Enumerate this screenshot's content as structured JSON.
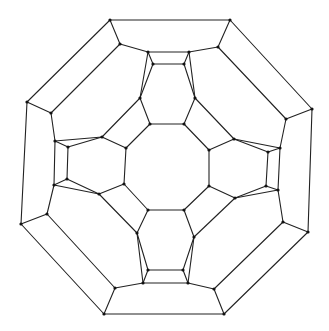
{
  "diagram": {
    "title": "",
    "type": "planar graph (Schlegel-style diagram)",
    "stroke_color": "#222222",
    "vertex_color": "#111111",
    "vertices": [
      [
        110,
        20
      ],
      [
        230,
        20
      ],
      [
        312,
        109
      ],
      [
        308,
        232
      ],
      [
        224,
        314
      ],
      [
        104,
        314
      ],
      [
        21,
        224
      ],
      [
        27,
        102
      ],
      [
        120,
        44
      ],
      [
        218,
        47
      ],
      [
        286,
        119
      ],
      [
        283,
        222
      ],
      [
        214,
        289
      ],
      [
        115,
        288
      ],
      [
        47,
        214
      ],
      [
        51,
        113
      ],
      [
        148,
        52
      ],
      [
        189,
        52
      ],
      [
        184,
        64
      ],
      [
        153,
        64
      ],
      [
        280,
        148
      ],
      [
        278,
        190
      ],
      [
        266,
        186
      ],
      [
        268,
        152
      ],
      [
        188,
        283
      ],
      [
        143,
        283
      ],
      [
        148,
        270
      ],
      [
        183,
        270
      ],
      [
        54,
        185
      ],
      [
        55,
        141
      ],
      [
        68,
        147
      ],
      [
        67,
        179
      ],
      [
        140,
        98
      ],
      [
        195,
        98
      ],
      [
        234,
        139
      ],
      [
        235,
        198
      ],
      [
        194,
        237
      ],
      [
        137,
        233
      ],
      [
        99,
        194
      ],
      [
        102,
        137
      ],
      [
        150,
        124
      ],
      [
        184,
        124
      ],
      [
        209,
        150
      ],
      [
        209,
        186
      ],
      [
        184,
        210
      ],
      [
        148,
        210
      ],
      [
        124,
        184
      ],
      [
        126,
        148
      ]
    ],
    "edges": [
      [
        0,
        1
      ],
      [
        1,
        2
      ],
      [
        2,
        3
      ],
      [
        3,
        4
      ],
      [
        4,
        5
      ],
      [
        5,
        6
      ],
      [
        6,
        7
      ],
      [
        7,
        0
      ],
      [
        0,
        8
      ],
      [
        1,
        9
      ],
      [
        2,
        10
      ],
      [
        3,
        11
      ],
      [
        4,
        12
      ],
      [
        5,
        13
      ],
      [
        6,
        14
      ],
      [
        7,
        15
      ],
      [
        15,
        8
      ],
      [
        9,
        10
      ],
      [
        11,
        12
      ],
      [
        13,
        14
      ],
      [
        8,
        16
      ],
      [
        16,
        17
      ],
      [
        17,
        9
      ],
      [
        16,
        19
      ],
      [
        17,
        18
      ],
      [
        18,
        19
      ],
      [
        10,
        20
      ],
      [
        20,
        21
      ],
      [
        21,
        11
      ],
      [
        20,
        23
      ],
      [
        21,
        22
      ],
      [
        22,
        23
      ],
      [
        12,
        24
      ],
      [
        24,
        25
      ],
      [
        25,
        13
      ],
      [
        24,
        27
      ],
      [
        25,
        26
      ],
      [
        26,
        27
      ],
      [
        14,
        28
      ],
      [
        28,
        29
      ],
      [
        29,
        15
      ],
      [
        29,
        30
      ],
      [
        28,
        31
      ],
      [
        30,
        31
      ],
      [
        16,
        32
      ],
      [
        19,
        32
      ],
      [
        18,
        33
      ],
      [
        17,
        33
      ],
      [
        20,
        34
      ],
      [
        23,
        34
      ],
      [
        22,
        35
      ],
      [
        21,
        35
      ],
      [
        24,
        36
      ],
      [
        27,
        36
      ],
      [
        26,
        37
      ],
      [
        25,
        37
      ],
      [
        28,
        38
      ],
      [
        31,
        38
      ],
      [
        30,
        39
      ],
      [
        29,
        39
      ],
      [
        40,
        41
      ],
      [
        41,
        42
      ],
      [
        42,
        43
      ],
      [
        43,
        44
      ],
      [
        44,
        45
      ],
      [
        45,
        46
      ],
      [
        46,
        47
      ],
      [
        47,
        40
      ],
      [
        32,
        40
      ],
      [
        33,
        41
      ],
      [
        34,
        42
      ],
      [
        35,
        43
      ],
      [
        36,
        44
      ],
      [
        37,
        45
      ],
      [
        38,
        46
      ],
      [
        39,
        47
      ],
      [
        32,
        39
      ],
      [
        33,
        34
      ],
      [
        35,
        36
      ],
      [
        37,
        38
      ]
    ]
  }
}
